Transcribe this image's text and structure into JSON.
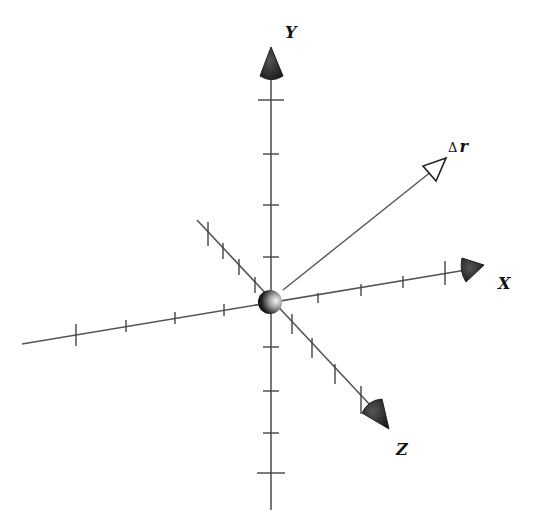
{
  "diagram": {
    "colors": {
      "background": "#ffffff",
      "axis": "#555555",
      "arrowhead": "#222222",
      "origin_sphere_dark": "#111111",
      "origin_sphere_light": "#f2f2f2"
    },
    "origin": {
      "x": 270,
      "y": 302,
      "r": 12
    },
    "axes": [
      {
        "id": "y",
        "label": "Y",
        "label_pos": {
          "x": 285,
          "y": 38
        },
        "line": {
          "x1": 271,
          "y1": 72,
          "x2": 271,
          "y2": 510
        },
        "arrowhead": {
          "type": "solid-cone",
          "tip": {
            "x": 271,
            "y": 47
          },
          "base_left": {
            "x": 260,
            "y": 76
          },
          "base_right": {
            "x": 283,
            "y": 76
          }
        },
        "ticks": [
          {
            "x": 271,
            "y": 100,
            "dx": 13,
            "dy": 0
          },
          {
            "x": 271,
            "y": 154,
            "dx": 8,
            "dy": 0
          },
          {
            "x": 271,
            "y": 205,
            "dx": 8,
            "dy": 0
          },
          {
            "x": 271,
            "y": 257,
            "dx": 8,
            "dy": 0
          },
          {
            "x": 271,
            "y": 347,
            "dx": 8,
            "dy": 0
          },
          {
            "x": 271,
            "y": 391,
            "dx": 8,
            "dy": 0
          },
          {
            "x": 271,
            "y": 433,
            "dx": 8,
            "dy": 0
          },
          {
            "x": 271,
            "y": 473,
            "dx": 14,
            "dy": 0
          }
        ]
      },
      {
        "id": "x",
        "label": "X",
        "label_pos": {
          "x": 498,
          "y": 289
        },
        "line": {
          "x1": 22,
          "y1": 344,
          "x2": 466,
          "y2": 270
        },
        "arrowhead": {
          "type": "solid-cone",
          "tip": {
            "x": 484,
            "y": 265
          },
          "base_left": {
            "x": 462,
            "y": 258
          },
          "base_right": {
            "x": 466,
            "y": 282
          }
        },
        "ticks": [
          {
            "x": 76,
            "y": 335,
            "dx": 0,
            "dy": 11
          },
          {
            "x": 126,
            "y": 326,
            "dx": 0,
            "dy": 6
          },
          {
            "x": 175,
            "y": 318,
            "dx": 0,
            "dy": 6
          },
          {
            "x": 224,
            "y": 310,
            "dx": 0,
            "dy": 6
          },
          {
            "x": 318,
            "y": 298,
            "dx": 0,
            "dy": 5
          },
          {
            "x": 361,
            "y": 290,
            "dx": 0,
            "dy": 6
          },
          {
            "x": 403,
            "y": 282,
            "dx": 0,
            "dy": 6
          },
          {
            "x": 445,
            "y": 273,
            "dx": 0,
            "dy": 12
          }
        ]
      },
      {
        "id": "z",
        "label": "Z",
        "label_pos": {
          "x": 396,
          "y": 455
        },
        "line": {
          "x1": 197,
          "y1": 220,
          "x2": 372,
          "y2": 407
        },
        "arrowhead": {
          "type": "solid-cone",
          "tip": {
            "x": 389,
            "y": 429
          },
          "base_left": {
            "x": 362,
            "y": 413
          },
          "base_right": {
            "x": 382,
            "y": 399
          }
        },
        "ticks": [
          {
            "x": 208,
            "y": 234,
            "dx": 0,
            "dy": 12
          },
          {
            "x": 223,
            "y": 251,
            "dx": 0,
            "dy": 8
          },
          {
            "x": 239,
            "y": 267,
            "dx": 0,
            "dy": 8
          },
          {
            "x": 255,
            "y": 285,
            "dx": 0,
            "dy": 8
          },
          {
            "x": 292,
            "y": 324,
            "dx": 0,
            "dy": 10
          },
          {
            "x": 312,
            "y": 348,
            "dx": 0,
            "dy": 10
          },
          {
            "x": 335,
            "y": 374,
            "dx": 0,
            "dy": 10
          },
          {
            "x": 361,
            "y": 400,
            "dx": 0,
            "dy": 14
          }
        ]
      }
    ],
    "vectors": [
      {
        "id": "delta-r",
        "label_symbol": "Δ",
        "label_var": "r",
        "label_pos": {
          "x": 448,
          "y": 152
        },
        "line": {
          "x1": 283,
          "y1": 290,
          "x2": 432,
          "y2": 171
        },
        "arrowhead": {
          "type": "hollow-triangle",
          "tip": {
            "x": 446,
            "y": 158
          },
          "base_left": {
            "x": 423,
            "y": 166
          },
          "base_right": {
            "x": 436,
            "y": 181
          }
        }
      }
    ]
  }
}
